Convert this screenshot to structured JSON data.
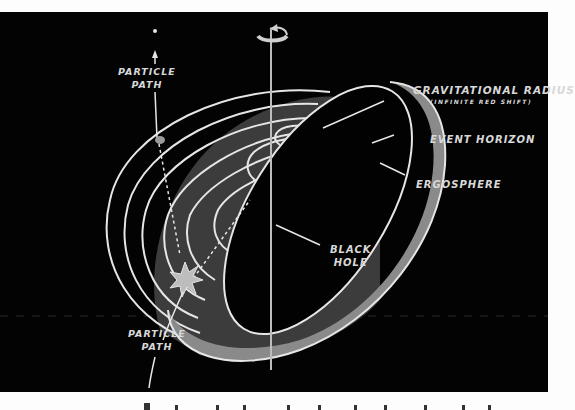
{
  "diagram": {
    "labels": {
      "gravitational_radius": "GRAVITATIONAL RADIUS",
      "infinite_red_shift": "(INFINITE RED SHIFT)",
      "event_horizon": "EVENT HORIZON",
      "ergosphere": "ERGOSPHERE",
      "black_hole_line1": "BLACK",
      "black_hole_line2": "HOLE",
      "particle_path_top_line1": "PARTICLE",
      "particle_path_top_line2": "PATH",
      "particle_path_bottom_line1": "PARTICLE",
      "particle_path_bottom_line2": "PATH"
    },
    "colors": {
      "background": "#030303",
      "page": "#fdfdfd",
      "ergosphere_fill": "#8a8a8a",
      "inner_shadow_fill": "#3c3c3c",
      "line": "#e6e6e6",
      "label": "#d8d8d8"
    },
    "icons": [
      "rotation-arrow-icon",
      "explosion-star-icon",
      "particle-dot-icon"
    ]
  }
}
